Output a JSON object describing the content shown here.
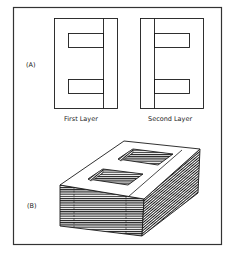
{
  "figure": {
    "panel_a": {
      "label": "(A)",
      "layers": [
        {
          "caption": "First Layer",
          "bar_side": "right"
        },
        {
          "caption": "Second Layer",
          "bar_side": "left"
        }
      ]
    },
    "panel_b": {
      "label": "(B)",
      "description": "Stacked laminations forming E-I transformer core"
    },
    "colors": {
      "line": "#1a1a1a",
      "background": "#ffffff",
      "frame": "#333333"
    }
  }
}
